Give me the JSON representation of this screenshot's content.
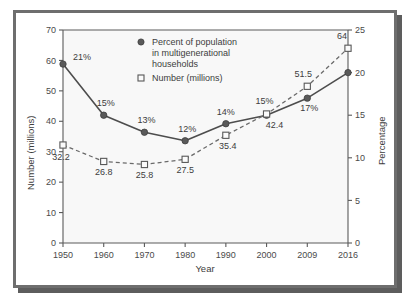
{
  "figure": {
    "frame_color": "#6e6e6e",
    "shadow_color": "#5d5d5d",
    "plot_background": "#f8f8f8"
  },
  "chart_data": {
    "type": "line",
    "title": "",
    "xlabel": "Year",
    "ylabel": "Number (millions)",
    "y2label": "Percentage",
    "categories": [
      "1950",
      "1960",
      "1970",
      "1980",
      "1990",
      "2000",
      "2009",
      "2016"
    ],
    "ylim": [
      0,
      70
    ],
    "y2lim": [
      0,
      25
    ],
    "yticks": [
      0,
      10,
      20,
      30,
      40,
      50,
      60,
      70
    ],
    "y2ticks": [
      0,
      5,
      10,
      15,
      20,
      25
    ],
    "grid": false,
    "legend_position": "top-center",
    "series": [
      {
        "name": "Percent of population in multigenerational households",
        "axis": "right",
        "marker": "filled-circle",
        "line_style": "solid",
        "color": "#4d4d4d",
        "values": [
          21,
          15,
          13,
          12,
          14,
          15,
          17,
          20
        ],
        "labels": [
          "21%",
          "15%",
          "13%",
          "12%",
          "14%",
          "15%",
          "17%",
          ""
        ]
      },
      {
        "name": "Number (millions)",
        "axis": "left",
        "marker": "open-square",
        "line_style": "dashed",
        "color": "#6a6a6a",
        "values": [
          32.2,
          26.8,
          25.8,
          27.5,
          35.4,
          42.4,
          51.5,
          64
        ],
        "labels": [
          "32.2",
          "26.8",
          "25.8",
          "27.5",
          "35.4",
          "42.4",
          "51.5",
          "64"
        ]
      }
    ]
  },
  "legend": {
    "entries": [
      {
        "marker": "filled-circle",
        "line1": "Percent of population",
        "line2": "in multigenerational",
        "line3": "households"
      },
      {
        "marker": "open-square",
        "line1": "Number (millions)"
      }
    ]
  }
}
